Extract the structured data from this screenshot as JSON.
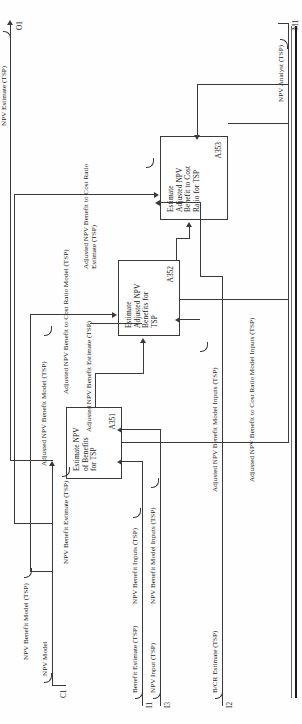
{
  "diagram": {
    "type": "IDEF0 activity decomposition",
    "boxes": [
      {
        "id": "A351",
        "title": "Estimate NPV of Benefits for TSP",
        "title_lines": [
          "Estimate NPV",
          "of Benefits",
          "for TSP"
        ]
      },
      {
        "id": "A352",
        "title": "Estimate Adjusted NPV Benefits for TSP",
        "title_lines": [
          "Estimate",
          "Adjusted NPV",
          "Benefits for",
          "TSP"
        ]
      },
      {
        "id": "A353",
        "title": "Estimate Adjusted NPV Benefit to Cost Ratio for TSP",
        "title_lines": [
          "Estimate",
          "Adjusted NPV",
          "Benefit to Cost",
          "Ratio for TSP"
        ]
      }
    ],
    "boundary_arrows": [
      {
        "code": "I1",
        "label": "Benefit Estimate (TSP)",
        "kind": "input"
      },
      {
        "code": "I3",
        "label": "NPV Input (TSP)",
        "kind": "input"
      },
      {
        "code": "I2",
        "label": "B/CR Estimate (TSP)",
        "kind": "input"
      },
      {
        "code": "C1",
        "label": "NPV Model",
        "kind": "control"
      },
      {
        "code": "M1",
        "label": "NPV Analyst (TSP)",
        "kind": "mechanism"
      },
      {
        "code": "O1",
        "label": "NPV Estimate (TSP)",
        "kind": "output"
      }
    ],
    "internal_arrows": [
      {
        "label": "NPV Benefit Inputs (TSP)"
      },
      {
        "label": "NPV Benefit Model Inputs (TSP)"
      },
      {
        "label": "NPV Benefit Model (TSP)"
      },
      {
        "label": "NPV Benefit Estimate (TSP)"
      },
      {
        "label": "Adjusted NPV Benefit Model (TSP)"
      },
      {
        "label": "Adjusted NPV Benefit Estimate (TSP)"
      },
      {
        "label": "Adjusted NPV Benefit Model Inputs (TSP)"
      },
      {
        "label": "Adjusted NPV Benefit to Cost Ratio Model (TSP)"
      },
      {
        "label": "Adjusted NPV Benefit to Cost Ratio Model Inputs (TSP)"
      },
      {
        "label": "Adjusted NPV Benefit to Cost Ratio Estimate (TSP)"
      }
    ]
  }
}
